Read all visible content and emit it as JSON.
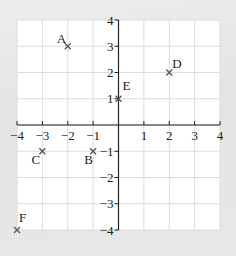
{
  "chart_data": {
    "type": "scatter",
    "title": "",
    "xlabel": "",
    "ylabel": "",
    "xlim": [
      -4,
      4
    ],
    "ylim": [
      -4,
      4
    ],
    "grid": true,
    "x_ticks": [
      -4,
      -3,
      -2,
      -1,
      1,
      2,
      3,
      4
    ],
    "y_ticks": [
      4,
      3,
      2,
      1,
      -1,
      -2,
      -3,
      -4
    ],
    "x_tick_labels": [
      "−4",
      "−3",
      "−2",
      "−1",
      "1",
      "2",
      "3",
      "4"
    ],
    "y_tick_labels": [
      "4",
      "3",
      "2",
      "1",
      "−1",
      "−2",
      "−3",
      "−4"
    ],
    "marker": "x",
    "points": [
      {
        "label": "A",
        "x": -2,
        "y": 3
      },
      {
        "label": "B",
        "x": -1,
        "y": -1
      },
      {
        "label": "C",
        "x": -3,
        "y": -1
      },
      {
        "label": "D",
        "x": 2,
        "y": 2
      },
      {
        "label": "E",
        "x": 0,
        "y": 1
      },
      {
        "label": "F",
        "x": -4,
        "y": -4
      }
    ]
  },
  "colors": {
    "background": "#e6e6e6",
    "plot_area": "#ffffff",
    "grid": "#dcdcdc",
    "axis": "#222222",
    "marker": "#555555"
  }
}
